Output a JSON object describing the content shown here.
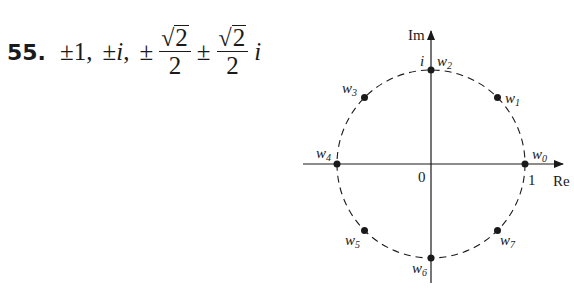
{
  "problem": {
    "number": "55.",
    "answer_parts": {
      "pm1": "±1,",
      "pm_i_sign": "±",
      "pm_i_var": "i",
      "pm_i_comma": ",",
      "pm_a": "±",
      "frac1_num": "2",
      "frac1_den": "2",
      "pm_b": "±",
      "frac2_num": "2",
      "frac2_den": "2",
      "imag_unit": "i"
    }
  },
  "diagram": {
    "axis_labels": {
      "real": "Re",
      "imag": "Im"
    },
    "tick_labels": {
      "origin": "0",
      "one": "1",
      "i": "i"
    },
    "points": [
      {
        "label": "w",
        "sub": "0"
      },
      {
        "label": "w",
        "sub": "1"
      },
      {
        "label": "w",
        "sub": "2"
      },
      {
        "label": "w",
        "sub": "3"
      },
      {
        "label": "w",
        "sub": "4"
      },
      {
        "label": "w",
        "sub": "5"
      },
      {
        "label": "w",
        "sub": "6"
      },
      {
        "label": "w",
        "sub": "7"
      }
    ],
    "circle_style": "dashed unit circle",
    "colors": {
      "ink": "#1a1a1a",
      "background": "#ffffff"
    }
  }
}
